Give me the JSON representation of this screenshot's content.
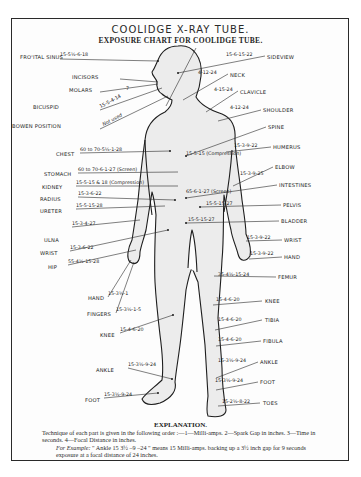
{
  "title": "COOLIDGE X-RAY TUBE.",
  "subtitle": "EXPOSURE CHART FOR COOLIDGE TUBE.",
  "left_labels": [
    {
      "name": "FRO'ITAL SINUS",
      "value": "15-5½-6-18",
      "x": 20,
      "y": 58,
      "vx": 60,
      "vy": 57
    },
    {
      "name": "INCISORS",
      "x": 72,
      "y": 78
    },
    {
      "name": "MOLARS",
      "x": 69,
      "y": 91
    },
    {
      "name": "BICUSPID",
      "x": 33,
      "y": 108
    },
    {
      "name": "BOWEN POSITION",
      "x": 12,
      "y": 127
    },
    {
      "name": "CHEST",
      "value": "60 to 70-5¼-1-28",
      "x": 56,
      "y": 155,
      "vx": 80,
      "vy": 152
    },
    {
      "name": "STOMACH",
      "value": "60 to 70-6-1-27 (Screen)",
      "x": 44,
      "y": 175,
      "vx": 78,
      "vy": 172
    },
    {
      "name": "KIDNEY",
      "value": "15-5-15 & 18 (Compression)",
      "x": 42,
      "y": 188,
      "vx": 76,
      "vy": 185
    },
    {
      "name": "RADIUS",
      "value": "15-3-6-22",
      "x": 40,
      "y": 200,
      "vx": 78,
      "vy": 196
    },
    {
      "name": "URETER",
      "value": "15-5-15-28",
      "x": 40,
      "y": 212,
      "vx": 76,
      "vy": 208
    },
    {
      "name": "ULNA",
      "value": "15-3-4-27",
      "x": 44,
      "y": 241,
      "vx": 72,
      "vy": 226
    },
    {
      "name": "WRIST",
      "value": "15-3-6-22",
      "x": 40,
      "y": 254,
      "vx": 70,
      "vy": 250
    },
    {
      "name": "HIP",
      "value": "55-4½-15-28",
      "x": 48,
      "y": 268,
      "vx": 68,
      "vy": 264
    },
    {
      "name": "HAND",
      "value": "15-3½-1",
      "x": 88,
      "y": 299,
      "vx": 108,
      "vy": 296
    },
    {
      "name": "FINGERS",
      "value": "15-3½-1-5",
      "x": 87,
      "y": 315,
      "vx": 116,
      "vy": 312
    },
    {
      "name": "KNEE",
      "value": "15-4-6-20",
      "x": 100,
      "y": 336,
      "vx": 120,
      "vy": 332
    },
    {
      "name": "ANKLE",
      "value": "15-3½-9-24",
      "x": 96,
      "y": 371,
      "vx": 128,
      "vy": 367
    },
    {
      "name": "FOOT",
      "value": "15-3½-9-24",
      "x": 85,
      "y": 401,
      "vx": 104,
      "vy": 397
    }
  ],
  "right_labels": [
    {
      "name": "SIDEVIEW",
      "value": "15-6-15-22",
      "x": 267,
      "y": 58,
      "vx": 226,
      "vy": 57
    },
    {
      "name": "NECK",
      "value": "4-12-24",
      "x": 230,
      "y": 76,
      "vx": 198,
      "vy": 75
    },
    {
      "name": "CLAVICLE",
      "value": "4-15-24",
      "x": 240,
      "y": 93,
      "vx": 214,
      "vy": 92
    },
    {
      "name": "SHOULDER",
      "value": "4-12-24",
      "x": 263,
      "y": 111,
      "vx": 230,
      "vy": 110
    },
    {
      "name": "SPINE",
      "value": "15-5-15 (Compression)",
      "x": 268,
      "y": 128,
      "vx": 186,
      "vy": 156
    },
    {
      "name": "HUMERUS",
      "value": "15-3-9-22",
      "x": 273,
      "y": 148,
      "vx": 234,
      "vy": 148
    },
    {
      "name": "ELBOW",
      "value": "15-3-9-25",
      "x": 275,
      "y": 168,
      "vx": 240,
      "vy": 176
    },
    {
      "name": "INTESTINES",
      "value": "65-6-1-27 (Screen)",
      "x": 279,
      "y": 186,
      "vx": 186,
      "vy": 194
    },
    {
      "name": "PELVIS",
      "value": "15-5-15-27",
      "x": 283,
      "y": 206,
      "vx": 206,
      "vy": 206
    },
    {
      "name": "BLADDER",
      "value": "15-5-15-27",
      "x": 281,
      "y": 222,
      "vx": 188,
      "vy": 222
    },
    {
      "name": "WRIST",
      "value": "15-3-9-22",
      "x": 284,
      "y": 241,
      "vx": 247,
      "vy": 240
    },
    {
      "name": "HAND",
      "value": "15-3-9-22",
      "x": 284,
      "y": 258,
      "vx": 250,
      "vy": 256
    },
    {
      "name": "FEMUR",
      "value": "35-4½-15-24",
      "x": 278,
      "y": 278,
      "vx": 218,
      "vy": 277
    },
    {
      "name": "KNEE",
      "value": "15-4-6-20",
      "x": 265,
      "y": 302,
      "vx": 216,
      "vy": 302
    },
    {
      "name": "TIBIA",
      "value": "15-4-6-20",
      "x": 265,
      "y": 321,
      "vx": 218,
      "vy": 322
    },
    {
      "name": "FIBULA",
      "value": "15-4-6-20",
      "x": 263,
      "y": 342,
      "vx": 218,
      "vy": 342
    },
    {
      "name": "ANKLE",
      "value": "15-3½-9-24",
      "x": 260,
      "y": 363,
      "vx": 218,
      "vy": 363
    },
    {
      "name": "FOOT",
      "value": "15-3½-9-24",
      "x": 260,
      "y": 383,
      "vx": 215,
      "vy": 383
    },
    {
      "name": "TOES",
      "value": "15-2½-8-22",
      "x": 263,
      "y": 404,
      "vx": 222,
      "vy": 404
    }
  ],
  "teeth_values": {
    "bicuspid": "15-5-4-14",
    "bowen": "Not used",
    "molars_mark": "7"
  },
  "explanation": {
    "title": "EXPLANATION.",
    "line1": "Technique of each part is given in the following order :—1—Milli-amps.   2—Spark Gap in inches.   3—Time in seconds.   4—Focal Distance in inches.",
    "example_label": "For Example:",
    "example_text": "\" Ankle 15   3½ –9 –24 \" means 15 Milli-amps. backing up a 3½ inch gap for 9 seconds exposure at a focal distance of 24 inches."
  }
}
